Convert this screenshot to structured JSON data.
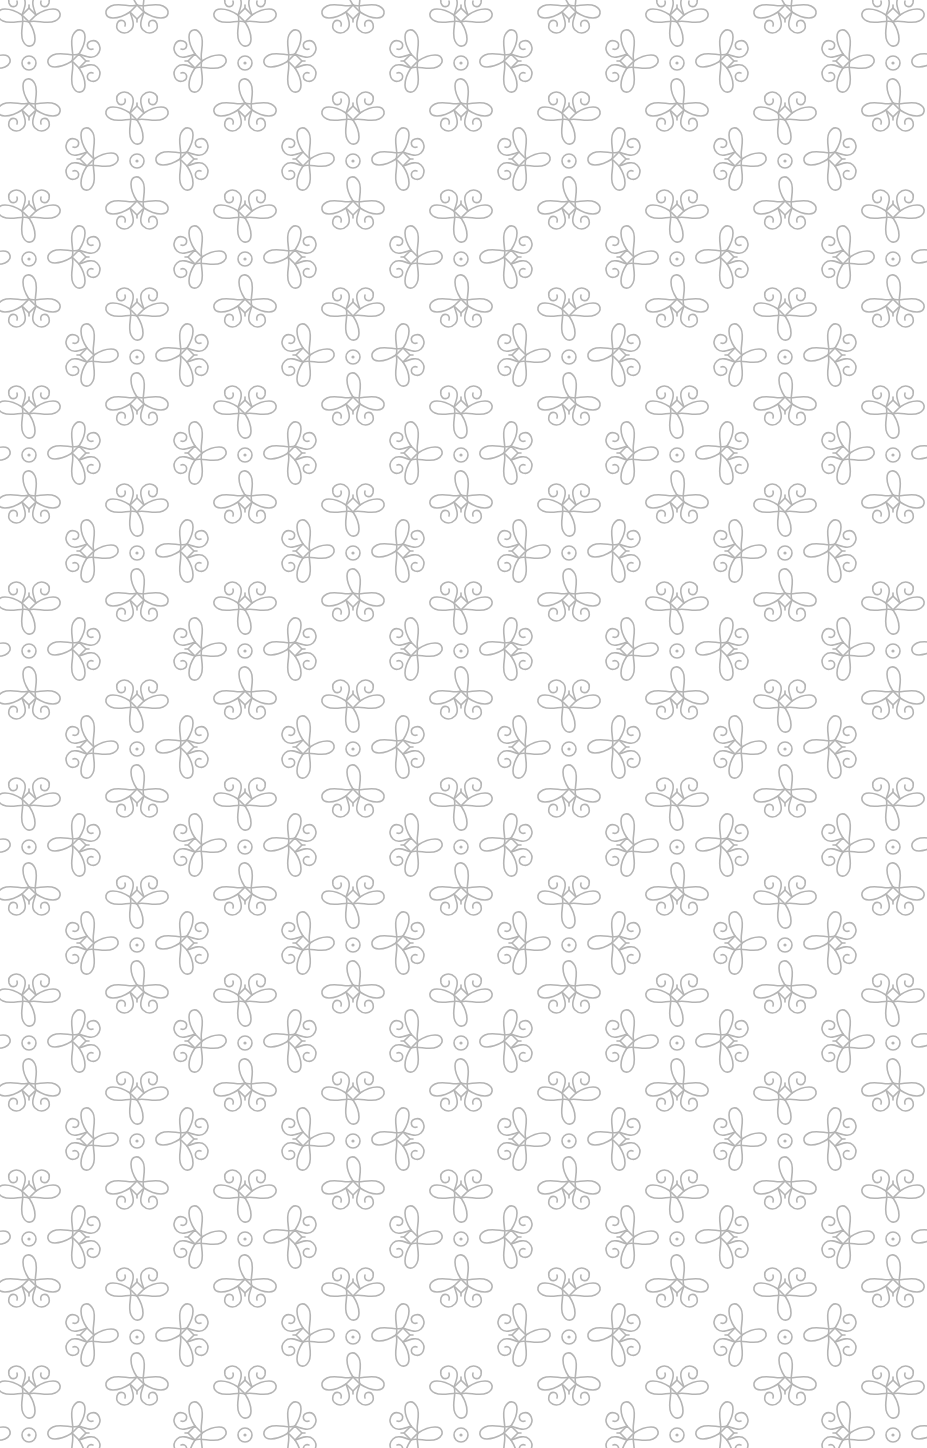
{
  "image": {
    "kind": "decorative-wallpaper-pattern",
    "width": 927,
    "height": 1448,
    "background_color": "#ffffff",
    "stroke_color": "#b4b4b4",
    "stroke_width": 1.6
  },
  "pattern": {
    "tile_width": 216,
    "tile_height": 196,
    "origin_x": 29,
    "origin_y": 63,
    "row_offset_x": 108,
    "row_offset_y": 98,
    "motif": {
      "center": "circle-dot",
      "circle_radius": 7,
      "dot_radius": 1.6,
      "petals": [
        {
          "direction": "left",
          "curls": "outward"
        },
        {
          "direction": "right",
          "curls": "outward"
        },
        {
          "direction": "up",
          "curls": "outward"
        },
        {
          "direction": "down",
          "curls": "outward"
        }
      ],
      "petal_offset_x": 50,
      "petal_offset_y": 48
    }
  }
}
